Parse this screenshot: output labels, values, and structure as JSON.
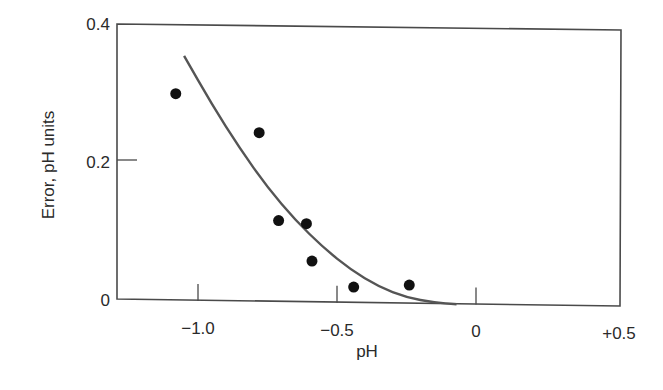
{
  "chart_data": {
    "type": "scatter",
    "title": "",
    "xlabel": "pH",
    "ylabel": "Error, pH units",
    "xlim": [
      -1.3,
      0.5
    ],
    "ylim": [
      0,
      0.4
    ],
    "grid": false,
    "legend": null,
    "x_ticks": [
      {
        "value": -1.0,
        "label": "−1.0"
      },
      {
        "value": -0.5,
        "label": "−0.5"
      },
      {
        "value": 0,
        "label": "0"
      },
      {
        "value": 0.5,
        "label": "+0.5"
      }
    ],
    "y_ticks": [
      {
        "value": 0,
        "label": "0"
      },
      {
        "value": 0.2,
        "label": "0.2"
      },
      {
        "value": 0.4,
        "label": "0.4"
      }
    ],
    "series": [
      {
        "name": "measured error",
        "kind": "scatter",
        "marker": "filled-circle",
        "color": "#111111",
        "points": [
          {
            "x": -1.08,
            "y": 0.3
          },
          {
            "x": -0.78,
            "y": 0.245
          },
          {
            "x": -0.71,
            "y": 0.118
          },
          {
            "x": -0.61,
            "y": 0.114
          },
          {
            "x": -0.59,
            "y": 0.06
          },
          {
            "x": -0.44,
            "y": 0.023
          },
          {
            "x": -0.24,
            "y": 0.027
          }
        ]
      },
      {
        "name": "fitted curve",
        "kind": "line",
        "color": "#555555",
        "points": [
          {
            "x": -1.05,
            "y": 0.355
          },
          {
            "x": -0.95,
            "y": 0.285
          },
          {
            "x": -0.85,
            "y": 0.222
          },
          {
            "x": -0.75,
            "y": 0.166
          },
          {
            "x": -0.65,
            "y": 0.119
          },
          {
            "x": -0.55,
            "y": 0.08
          },
          {
            "x": -0.45,
            "y": 0.048
          },
          {
            "x": -0.35,
            "y": 0.024
          },
          {
            "x": -0.25,
            "y": 0.009
          },
          {
            "x": -0.15,
            "y": 0.002
          },
          {
            "x": -0.07,
            "y": 0.0
          }
        ]
      }
    ]
  },
  "axes": {
    "x_label": "pH",
    "y_label": "Error, pH units",
    "x_tick_labels": [
      "−1.0",
      "−0.5",
      "0",
      "+0.5"
    ],
    "y_tick_labels": [
      "0",
      "0.2",
      "0.4"
    ]
  }
}
